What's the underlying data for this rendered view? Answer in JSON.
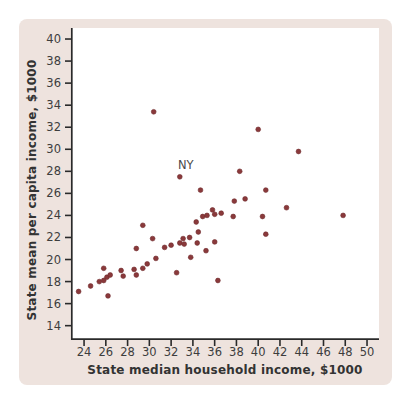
{
  "colors": {
    "card_bg": "#eee3de",
    "plot_bg": "#ffffff",
    "dot": "#8a393b",
    "axis": "#2a2a2a",
    "text": "#3d3d3d"
  },
  "chart_data": {
    "type": "scatter",
    "title": "",
    "xlabel": "State median household income, $1000",
    "ylabel": "State mean per capita income, $1000",
    "xlim": [
      22.8,
      51.1
    ],
    "ylim": [
      12.7,
      41.0
    ],
    "grid": false,
    "legend": "none",
    "x_ticks": [
      24,
      26,
      28,
      30,
      32,
      34,
      36,
      38,
      40,
      42,
      44,
      46,
      48,
      50
    ],
    "y_ticks": [
      14,
      16,
      18,
      20,
      22,
      24,
      26,
      28,
      30,
      32,
      34,
      36,
      38,
      40
    ],
    "annotation": {
      "label": "NY",
      "x": 32.8,
      "y": 27.5
    },
    "points": [
      [
        23.5,
        17.1
      ],
      [
        24.6,
        17.6
      ],
      [
        25.4,
        18.0
      ],
      [
        25.8,
        18.1
      ],
      [
        25.8,
        19.2
      ],
      [
        26.1,
        18.4
      ],
      [
        26.4,
        18.6
      ],
      [
        26.2,
        16.7
      ],
      [
        27.4,
        19.0
      ],
      [
        27.6,
        18.5
      ],
      [
        28.6,
        19.1
      ],
      [
        28.8,
        18.6
      ],
      [
        29.4,
        19.2
      ],
      [
        29.8,
        19.6
      ],
      [
        28.8,
        21.0
      ],
      [
        29.4,
        23.1
      ],
      [
        30.3,
        21.9
      ],
      [
        30.6,
        20.1
      ],
      [
        31.4,
        21.1
      ],
      [
        32.0,
        21.3
      ],
      [
        32.5,
        18.8
      ],
      [
        32.8,
        21.5
      ],
      [
        33.2,
        21.4
      ],
      [
        33.1,
        21.9
      ],
      [
        33.7,
        22.0
      ],
      [
        33.8,
        20.2
      ],
      [
        34.4,
        21.5
      ],
      [
        34.3,
        23.4
      ],
      [
        34.5,
        22.5
      ],
      [
        35.2,
        20.8
      ],
      [
        36.0,
        21.6
      ],
      [
        36.3,
        18.1
      ],
      [
        34.9,
        23.9
      ],
      [
        35.3,
        24.0
      ],
      [
        35.8,
        24.5
      ],
      [
        36.0,
        24.1
      ],
      [
        36.6,
        24.2
      ],
      [
        37.7,
        23.9
      ],
      [
        30.4,
        33.4
      ],
      [
        32.8,
        27.5
      ],
      [
        34.7,
        26.3
      ],
      [
        37.8,
        25.3
      ],
      [
        38.8,
        25.5
      ],
      [
        38.3,
        28.0
      ],
      [
        40.0,
        31.8
      ],
      [
        40.4,
        23.9
      ],
      [
        40.7,
        26.3
      ],
      [
        40.7,
        22.3
      ],
      [
        42.6,
        24.7
      ],
      [
        43.7,
        29.8
      ],
      [
        47.8,
        24.0
      ]
    ]
  }
}
